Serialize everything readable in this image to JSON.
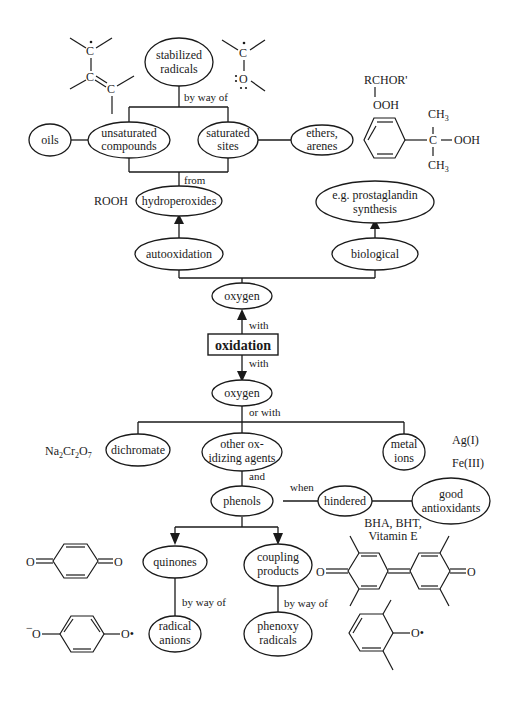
{
  "title": "oxidation",
  "nodes": {
    "stabilized_radicals": [
      "stabilized",
      "radicals"
    ],
    "oils": [
      "oils"
    ],
    "unsaturated_compounds": [
      "unsaturated",
      "compounds"
    ],
    "saturated_sites": [
      "saturated",
      "sites"
    ],
    "ethers_arenes": [
      "ethers,",
      "arenes"
    ],
    "hydroperoxides": [
      "hydroperoxides"
    ],
    "prostaglandin": [
      "e.g. prostaglandin",
      "synthesis"
    ],
    "autooxidation": [
      "autooxidation"
    ],
    "biological": [
      "biological"
    ],
    "oxygen_top": [
      "oxygen"
    ],
    "oxygen_bottom": [
      "oxygen"
    ],
    "dichromate": [
      "dichromate"
    ],
    "other_oxidizing": [
      "other ox-",
      "idizing agents"
    ],
    "metal_ions": [
      "metal",
      "ions"
    ],
    "phenols": [
      "phenols"
    ],
    "hindered": [
      "hindered"
    ],
    "good_antioxidants": [
      "good",
      "antioxidants"
    ],
    "quinones": [
      "quinones"
    ],
    "coupling_products": [
      "coupling",
      "products"
    ],
    "radical_anions": [
      "radical",
      "anions"
    ],
    "phenoxy_radicals": [
      "phenoxy",
      "radicals"
    ]
  },
  "edge_labels": {
    "by_way_of_top": "by way of",
    "from": "from",
    "with_up": "with",
    "with_down": "with",
    "or_with": "or with",
    "and": "and",
    "when": "when",
    "by_way_of_quinones": "by way of",
    "by_way_of_coupling": "by way of"
  },
  "annotations": {
    "rooh": "ROOH",
    "rchor": "RCHOR'",
    "ooh_1": "OOH",
    "ch3_top": "CH",
    "ch3_bottom": "CH",
    "sub3": "3",
    "cumene_c": "C",
    "cumene_ooh": "OOH",
    "na": "Na",
    "cr": "Cr",
    "o": "O",
    "sub2": "2",
    "sub7": "7",
    "ag": "Ag(I)",
    "fe": "Fe(III)",
    "bha": "BHA, BHT,",
    "vitamin_e": "Vitamin E",
    "allyl_c1": "C",
    "allyl_c2": "C",
    "allyl_c3": "C",
    "ketyl_c": "C",
    "ketyl_o": "O",
    "quinone_o_left": "O",
    "quinone_o_right": "O",
    "semiq_o_left": "O",
    "semiq_o_right": "O•",
    "minus": "−",
    "dpq_o_left": "O",
    "dpq_o_right": "O",
    "phenoxy_o": "O•"
  },
  "colors": {
    "ink": "#1a1a1a",
    "background": "#ffffff"
  }
}
